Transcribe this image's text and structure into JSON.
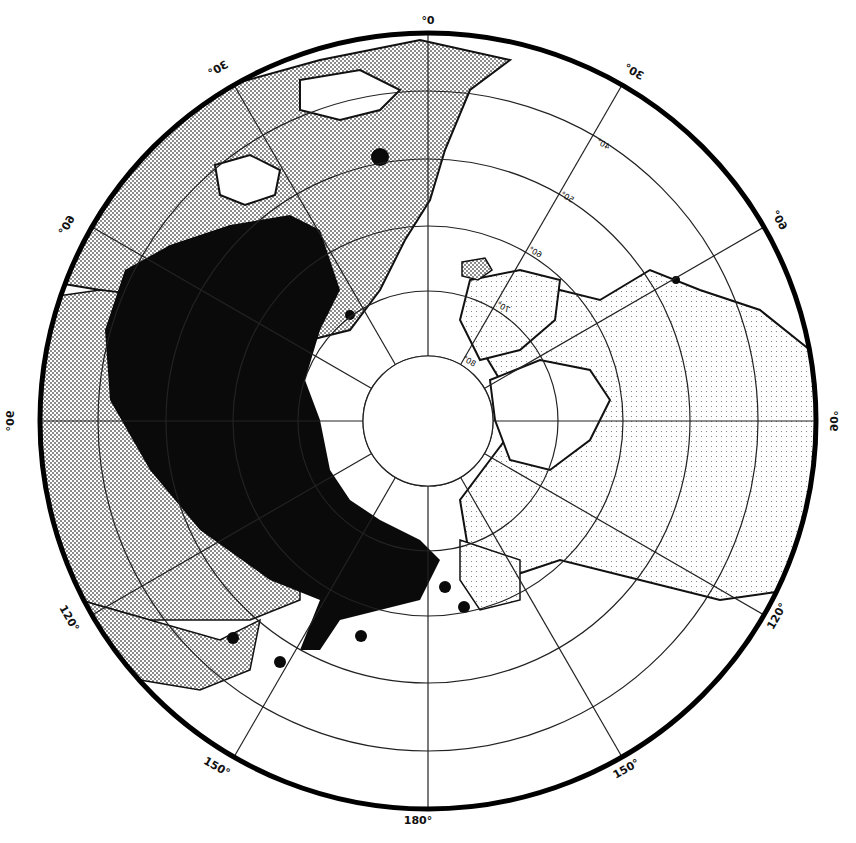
{
  "map": {
    "projection": "north-polar azimuthal (mirrored)",
    "colors": {
      "background": "#ffffff",
      "ink": "#111111",
      "land_stipple": "#cfcfcf",
      "range_fill": "#0a0a0a"
    },
    "longitude_labels": [
      {
        "text": "0°",
        "angle": 0
      },
      {
        "text": "30°",
        "angle": -30
      },
      {
        "text": "30°",
        "angle": 30
      },
      {
        "text": "60°",
        "angle": -60
      },
      {
        "text": "60°",
        "angle": 60
      },
      {
        "text": "90°",
        "angle": -90
      },
      {
        "text": "90°",
        "angle": 90
      },
      {
        "text": "120°",
        "angle": -120
      },
      {
        "text": "120°",
        "angle": 120
      },
      {
        "text": "150°",
        "angle": -150
      },
      {
        "text": "150°",
        "angle": 150
      },
      {
        "text": "180°",
        "angle": 180
      }
    ],
    "latitude_labels": [
      "40°",
      "50°",
      "60°",
      "70°",
      "80°"
    ],
    "legend": {
      "black_area": "Range (solid black)",
      "dots": "Isolated occurrences"
    }
  }
}
